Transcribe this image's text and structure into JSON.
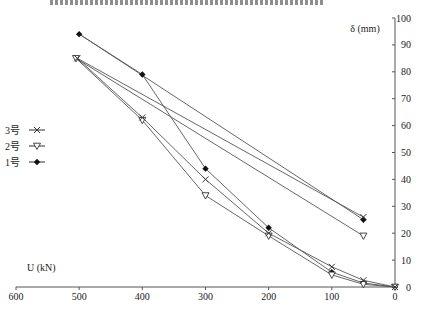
{
  "orientation": "rotated-180",
  "chart_data": {
    "type": "line",
    "title": "",
    "xlabel": "U (kN)",
    "ylabel": "δ (mm)",
    "xlim": [
      0,
      600
    ],
    "ylim": [
      0,
      100
    ],
    "x_ticks": [
      "0",
      "100",
      "200",
      "300",
      "400",
      "500",
      "600"
    ],
    "y_ticks": [
      "0",
      "10",
      "20",
      "30",
      "40",
      "50",
      "60",
      "70",
      "80",
      "90",
      "100"
    ],
    "grid": false,
    "legend_position": "right-middle",
    "series": [
      {
        "name": "1号",
        "marker": "diamond-filled",
        "points": [
          [
            0,
            0
          ],
          [
            50,
            1.5
          ],
          [
            100,
            5.5
          ],
          [
            200,
            22
          ],
          [
            300,
            44
          ],
          [
            400,
            79
          ],
          [
            500,
            94
          ],
          [
            50,
            25
          ]
        ]
      },
      {
        "name": "2号",
        "marker": "triangle-down-open",
        "points": [
          [
            0,
            0
          ],
          [
            50,
            1
          ],
          [
            100,
            4.5
          ],
          [
            200,
            19
          ],
          [
            300,
            34
          ],
          [
            400,
            62
          ],
          [
            505,
            85
          ],
          [
            50,
            19
          ]
        ]
      },
      {
        "name": "3号",
        "marker": "x",
        "points": [
          [
            0,
            0
          ],
          [
            50,
            2.5
          ],
          [
            100,
            7.5
          ],
          [
            200,
            20
          ],
          [
            300,
            40
          ],
          [
            400,
            63
          ],
          [
            503,
            85
          ],
          [
            50,
            26
          ]
        ]
      }
    ]
  },
  "labels": {
    "xlabel": "U (kN)",
    "ylabel": "δ (mm)"
  },
  "legend": [
    {
      "label": "1号",
      "marker": "diamond-filled"
    },
    {
      "label": "2号",
      "marker": "triangle-down-open"
    },
    {
      "label": "3号",
      "marker": "x"
    }
  ],
  "colors": {
    "line": "#555555",
    "marker": "#111111",
    "axis": "#555555"
  }
}
